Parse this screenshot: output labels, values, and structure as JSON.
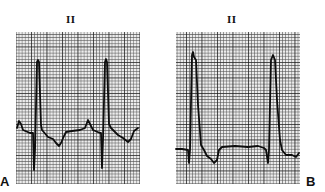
{
  "figure": {
    "panels": [
      {
        "id": "A",
        "panel_letter": "A",
        "lead_label": "II",
        "waveform_points": "17,128 19,121 21,124 23,130 30,133 33,133 34,170 35,150 37,62 38,60 39,62 41,125 42,130 48,137 53,139 56,143 59,146 61,143 64,136 66,132 72,131 80,130 85,128 88,120 90,124 93,130 100,133 101,133 102,168 103,140 105,62 106,59 107,62 109,124 111,128 118,135 123,138 128,142 131,139 134,131 138,128"
      },
      {
        "id": "B",
        "panel_letter": "B",
        "lead_label": "II",
        "waveform_points": "176,149 182,149 188,150 189,163 190,150 192,55 193,52 194,57 196,60 198,105 201,145 204,150 207,156 211,159 214,163 217,160 219,150 222,147 235,146 248,147 258,146 264,148 266,150 268,163 269,150 271,60 273,55 275,60 277,100 280,140 282,150 286,155 292,155 296,157 299,153"
      }
    ],
    "colors": {
      "grid_minor": "#6a6a6a",
      "grid_major": "#1a1a1a",
      "trace": "#0d0d0d",
      "paper": "#e9e9e9"
    }
  }
}
